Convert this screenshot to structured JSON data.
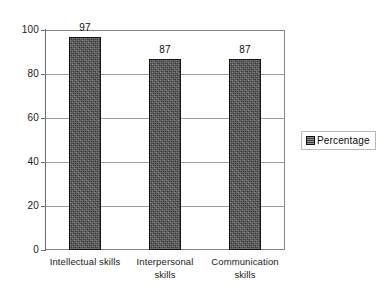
{
  "chart_data": {
    "type": "bar",
    "title": "",
    "subtitle": "",
    "xlabel": "",
    "ylabel": "",
    "categories": [
      "Intellectual skills",
      "Interpersonal skills",
      "Communication skills"
    ],
    "category_lines": [
      [
        "Intellectual skills"
      ],
      [
        "Interpersonal",
        "skills"
      ],
      [
        "Communication",
        "skills"
      ]
    ],
    "series": [
      {
        "name": "Percentage",
        "values": [
          97,
          87,
          87
        ],
        "color": "#58585a"
      }
    ],
    "data_labels": [
      "97",
      "87",
      "87"
    ],
    "ylim": [
      0,
      100
    ],
    "ytick_values": [
      0,
      20,
      40,
      60,
      80,
      100
    ],
    "ytick_labels": [
      "0",
      "20",
      "40",
      "60",
      "80",
      "100"
    ],
    "grid": {
      "horizontal": true,
      "vertical": false,
      "color": "#9a9a9a"
    },
    "legend": {
      "entries": [
        "Percentage"
      ],
      "position": "right",
      "bordered": true
    },
    "plot_border_color": "#868686",
    "background": "#ffffff"
  }
}
